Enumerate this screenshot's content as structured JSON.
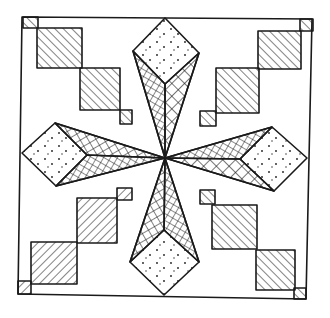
{
  "colors": {
    "ink": "#1a1a1a",
    "paper": "#ffffff"
  },
  "elements": {
    "frame": "square border",
    "star_points": 8,
    "star_fill": "cross-hatch",
    "diamonds": 4,
    "diamond_fill": "stippled dots",
    "corner_steps": 4,
    "step_fill": "diagonal hatching"
  }
}
